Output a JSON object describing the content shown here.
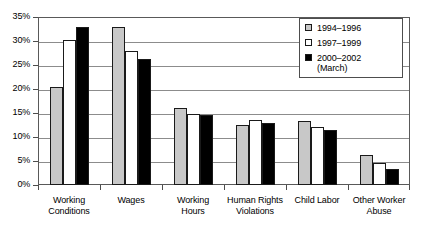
{
  "chart_data": {
    "type": "bar",
    "title": "",
    "xlabel": "",
    "ylabel": "",
    "ylim": [
      0,
      35
    ],
    "grid": true,
    "legend_position": "top-right",
    "categories": [
      "Working\nConditions",
      "Wages",
      "Working\nHours",
      "Human Rights\nViolations",
      "Child Labor",
      "Other Worker\nAbuse"
    ],
    "y_ticks": [
      "0%",
      "5%",
      "10%",
      "15%",
      "20%",
      "25%",
      "30%",
      "35%"
    ],
    "y_tick_values": [
      0,
      5,
      10,
      15,
      20,
      25,
      30,
      35
    ],
    "series": [
      {
        "name": "1994–1996",
        "color": "#c8c8c8",
        "values": [
          20.5,
          33.0,
          16.0,
          12.6,
          13.4,
          6.3
        ]
      },
      {
        "name": "1997–1999",
        "color": "#ffffff",
        "values": [
          30.2,
          28.0,
          14.7,
          13.5,
          12.0,
          4.5
        ]
      },
      {
        "name": "2000–2002\n(March)",
        "color": "#000000",
        "values": [
          33.0,
          26.3,
          14.5,
          13.0,
          11.5,
          3.3
        ]
      }
    ]
  },
  "legend": {
    "items": [
      {
        "label": "1994–1996",
        "color": "#c8c8c8"
      },
      {
        "label": "1997–1999",
        "color": "#ffffff"
      },
      {
        "label": "2000–2002\n(March)",
        "color": "#000000"
      }
    ]
  },
  "colors": {
    "series_1": "#c8c8c8",
    "series_2": "#ffffff",
    "series_3": "#000000",
    "gridline": "#8c8c8c",
    "axis": "#595959",
    "bar_outline": "#1a1a1a"
  }
}
